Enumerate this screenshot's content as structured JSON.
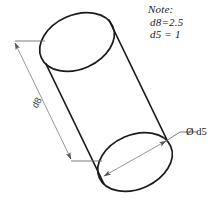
{
  "drawing": {
    "title": "Cylinder Technical Drawing",
    "width": 219,
    "height": 207,
    "background_color": "#ffffff",
    "line_color": "#1b1b1b",
    "dimension_line_color": "#6e6e6e",
    "object": "cylinder"
  },
  "note": {
    "heading": "Note:",
    "line_1": "d8=2.5",
    "line_2": "d5 = 1"
  },
  "dimensions": {
    "length_label": "d8",
    "diameter_label": "Ø d5",
    "diameter_symbol": "Ø",
    "diameter_name": "d5",
    "length_value": "2.5",
    "diameter_value": "1"
  },
  "geometry": {
    "top_ellipse": {
      "cx": 77,
      "cy": 42,
      "rx": 39,
      "ry": 27,
      "rotation": -24
    },
    "bottom_ellipse": {
      "cx": 135,
      "cy": 162,
      "rx": 39,
      "ry": 27,
      "rotation": -24
    },
    "side_left": {
      "x1": 46,
      "y1": 64,
      "x2": 104,
      "y2": 184
    },
    "side_right": {
      "x1": 109,
      "y1": 20,
      "x2": 167,
      "y2": 140
    },
    "dimension_line": {
      "x1": 15,
      "y1": 43,
      "x2": 71,
      "y2": 159
    },
    "extension_top": {
      "x1": 15,
      "y1": 41,
      "x2": 45,
      "y2": 41
    },
    "extension_bottom": {
      "x1": 71,
      "y1": 161,
      "x2": 102,
      "y2": 161
    },
    "diameter_line": {
      "x1": 104,
      "y1": 176,
      "x2": 166,
      "y2": 141
    },
    "leader_line": {
      "x1": 166,
      "y1": 141,
      "x2": 180,
      "y2": 132,
      "x3": 196,
      "y3": 132
    }
  }
}
